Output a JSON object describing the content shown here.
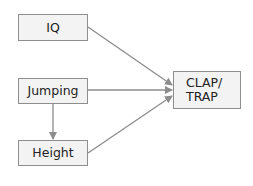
{
  "diagram": {
    "nodes": [
      {
        "id": "iq",
        "label": "IQ"
      },
      {
        "id": "jumping",
        "label": "Jumping"
      },
      {
        "id": "height",
        "label": "Height"
      },
      {
        "id": "clap_trap",
        "label": "CLAP/\nTRAP",
        "line1": "CLAP/",
        "line2": "TRAP"
      }
    ],
    "edges": [
      {
        "from": "iq",
        "to": "clap_trap"
      },
      {
        "from": "jumping",
        "to": "clap_trap"
      },
      {
        "from": "height",
        "to": "clap_trap"
      },
      {
        "from": "jumping",
        "to": "height"
      }
    ],
    "colors": {
      "box_fill": "#f3f3f3",
      "box_border": "#8e8e8e",
      "arrow": "#8c8c8c",
      "text": "#222222"
    }
  }
}
